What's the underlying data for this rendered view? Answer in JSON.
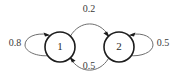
{
  "diagram": {
    "kind": "markov-chain-state-diagram",
    "states": [
      {
        "id": "s1",
        "label": "1",
        "cx": 60,
        "cy": 47,
        "r": 15
      },
      {
        "id": "s2",
        "label": "2",
        "cx": 119,
        "cy": 47,
        "r": 15
      }
    ],
    "transitions": [
      {
        "id": "t11",
        "from": "1",
        "to": "1",
        "label": "0.8",
        "kind": "self-loop",
        "side": "left",
        "label_x": 15,
        "label_y": 44
      },
      {
        "id": "t12",
        "from": "1",
        "to": "2",
        "label": "0.2",
        "kind": "arc",
        "side": "top",
        "label_x": 89,
        "label_y": 10
      },
      {
        "id": "t21",
        "from": "2",
        "to": "1",
        "label": "0.5",
        "kind": "arc",
        "side": "bottom",
        "label_x": 89,
        "label_y": 67
      },
      {
        "id": "t22",
        "from": "2",
        "to": "2",
        "label": "0.5",
        "kind": "self-loop",
        "side": "right",
        "label_x": 163,
        "label_y": 44
      }
    ],
    "colors": {
      "background": "#ffffff",
      "state_stroke": "#1c1c1c",
      "state_fill": "#ffffff",
      "edge_stroke": "#6e6e6e",
      "arrow_fill": "#1c1c1c",
      "state_text": "#2b2b2b",
      "edge_text": "#3a3a3a"
    }
  }
}
